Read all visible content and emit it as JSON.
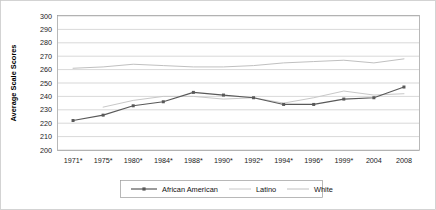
{
  "chart_data": {
    "type": "line",
    "title": "",
    "xlabel": "",
    "ylabel": "Average Scale Scores",
    "ylim": [
      200,
      300
    ],
    "ytick_step": 10,
    "grid": true,
    "legend_position": "bottom",
    "categories": [
      "1971*",
      "1975*",
      "1980*",
      "1984*",
      "1988*",
      "1990*",
      "1992*",
      "1994*",
      "1996*",
      "1999*",
      "2004",
      "2008"
    ],
    "yticks": [
      300,
      290,
      280,
      270,
      260,
      250,
      240,
      230,
      220,
      210,
      200
    ],
    "series": [
      {
        "name": "African American",
        "color": "#595959",
        "marker": "square",
        "values": [
          222,
          226,
          233,
          236,
          243,
          241,
          239,
          234,
          234,
          238,
          239,
          247
        ]
      },
      {
        "name": "Latino",
        "color": "#c8c8c8",
        "marker": "none",
        "values": [
          null,
          232,
          237,
          240,
          240,
          238,
          239,
          235,
          239,
          244,
          241,
          242
        ]
      },
      {
        "name": "White",
        "color": "#c0c0c0",
        "marker": "none",
        "values": [
          261,
          262,
          264,
          263,
          262,
          262,
          263,
          265,
          266,
          267,
          265,
          268
        ]
      }
    ]
  },
  "legend": {
    "items": [
      {
        "label": "African American"
      },
      {
        "label": "Latino"
      },
      {
        "label": "White"
      }
    ]
  },
  "colors": {
    "african_american": "#595959",
    "latino": "#c8c8c8",
    "white": "#c0c0c0",
    "gridline": "#bdbdbd",
    "border": "#9a9a9a"
  }
}
